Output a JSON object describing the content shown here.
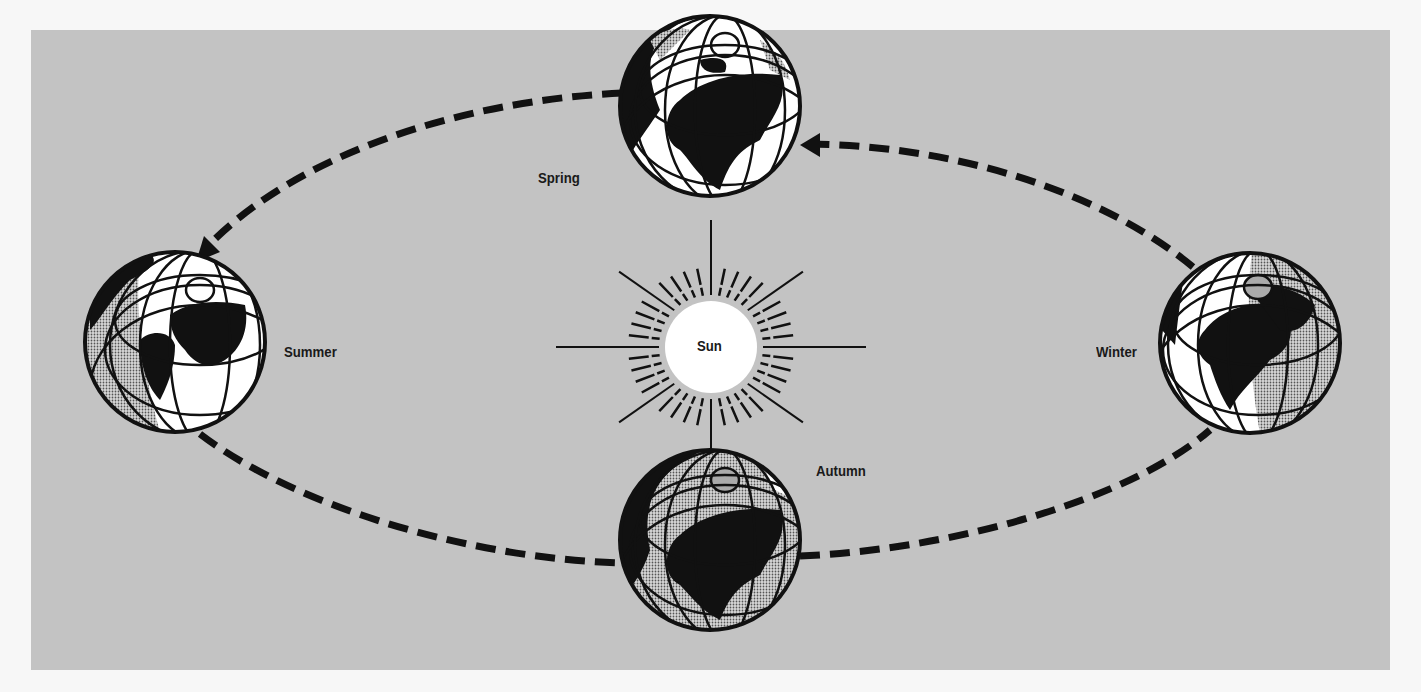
{
  "diagram": {
    "colors": {
      "page_background": "#f7f7f7",
      "panel_background": "#c3c3c3",
      "ink": "#111111",
      "lit": "#ffffff",
      "shaded": "#8a8a8a"
    },
    "center": {
      "label": "Sun"
    },
    "seasons": [
      {
        "id": "spring",
        "label": "Spring",
        "position": "top"
      },
      {
        "id": "summer",
        "label": "Summer",
        "position": "left"
      },
      {
        "id": "autumn",
        "label": "Autumn",
        "position": "bottom"
      },
      {
        "id": "winter",
        "label": "Winter",
        "position": "right"
      }
    ],
    "orbit": {
      "style": "dashed",
      "direction": "counter-clockwise"
    }
  }
}
